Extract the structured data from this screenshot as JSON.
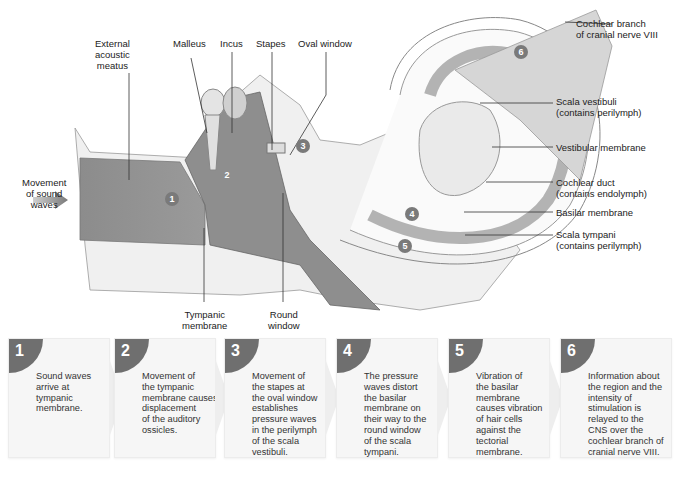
{
  "diagram": {
    "labels": {
      "external_acoustic_meatus": "External\nacoustic\nmeatus",
      "malleus": "Malleus",
      "incus": "Incus",
      "stapes": "Stapes",
      "oval_window": "Oval window",
      "cochlear_branch": "Cochlear branch\nof cranial nerve VIII",
      "scala_vestibuli": "Scala vestibuli\n(contains perilymph)",
      "vestibular_membrane": "Vestibular membrane",
      "cochlear_duct": "Cochlear duct\n(contains endolymph)",
      "basilar_membrane": "Basilar membrane",
      "scala_tympani": "Scala tympani\n(contains perilymph)",
      "movement_of_sound_waves": "Movement\nof sound\nwaves",
      "tympanic_membrane": "Tympanic\nmembrane",
      "round_window": "Round\nwindow"
    },
    "badges": [
      "1",
      "2",
      "3",
      "4",
      "5",
      "6"
    ],
    "colors": {
      "badge": "#7a7a7a",
      "canal": "#8a8a8a",
      "bone": "#efefef",
      "duct": "#b5b5b5"
    }
  },
  "steps": [
    {
      "number": "1",
      "text": "Sound waves\narrive at\ntympanic\nmembrane."
    },
    {
      "number": "2",
      "text": "Movement of\nthe tympanic\nmembrane causes\ndisplacement\nof the auditory\nossicles."
    },
    {
      "number": "3",
      "text": "Movement of\nthe stapes at\nthe oval window\nestablishes\npressure waves\nin the perilymph\nof the scala\nvestibuli."
    },
    {
      "number": "4",
      "text": "The pressure\nwaves distort\nthe basilar\nmembrane on\ntheir way to the\nround window\nof the scala\ntympani."
    },
    {
      "number": "5",
      "text": "Vibration of\nthe basilar\nmembrane\ncauses vibration\nof hair cells\nagainst  the\ntectorial\nmembrane."
    },
    {
      "number": "6",
      "text": "Information about\nthe region and the\nintensity of\nstimulation is\nrelayed to the\nCNS over the\ncochlear branch of\ncranial nerve VIII."
    }
  ]
}
